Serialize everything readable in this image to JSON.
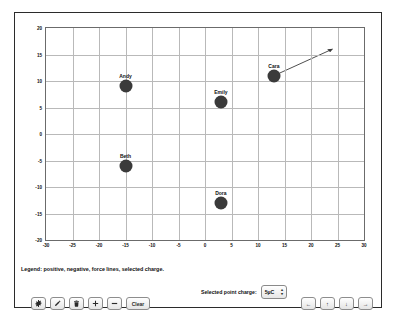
{
  "chart_data": {
    "type": "scatter",
    "title": "",
    "xlabel": "",
    "ylabel": "",
    "xlim": [
      -30,
      30
    ],
    "ylim": [
      -20,
      20
    ],
    "xticks": [
      "-30",
      "-25",
      "-20",
      "-15",
      "-10",
      "-5",
      "0",
      "5",
      "10",
      "15",
      "20",
      "25",
      "30"
    ],
    "yticks": [
      "20",
      "15",
      "10",
      "5",
      "0",
      "-5",
      "-10",
      "-15",
      "-20"
    ],
    "grid": true,
    "legend_position": "below-plot",
    "points": [
      {
        "label": "Andy",
        "x": -15,
        "y": 9,
        "marker": "filled-circle",
        "color": "#3a3a3a"
      },
      {
        "label": "Beth",
        "x": -15,
        "y": -6,
        "marker": "filled-circle",
        "color": "#3a3a3a"
      },
      {
        "label": "Cara",
        "x": 13,
        "y": 11,
        "marker": "filled-circle",
        "color": "#3a3a3a"
      },
      {
        "label": "Dora",
        "x": 3,
        "y": -13,
        "marker": "filled-circle",
        "color": "#3a3a3a"
      },
      {
        "label": "Emily",
        "x": 3,
        "y": 6,
        "marker": "filled-circle",
        "color": "#3a3a3a"
      }
    ],
    "vectors": [
      {
        "from_label": "Cara",
        "x1": 13,
        "y1": 11,
        "x2": 24,
        "y2": 16,
        "style": "arrow",
        "color": "#3a3a3a"
      }
    ]
  },
  "legend": {
    "text": "Legend: positive, negative, force lines, selected charge."
  },
  "charge_selector": {
    "label": "Selected point charge:",
    "value": "5µC",
    "options": [
      "5µC"
    ]
  },
  "tool_buttons": [
    {
      "name": "settings",
      "icon": "gear-icon",
      "label": ""
    },
    {
      "name": "edit",
      "icon": "pencil-icon",
      "label": ""
    },
    {
      "name": "delete",
      "icon": "trash-icon",
      "label": ""
    },
    {
      "name": "increase",
      "icon": "plus-icon",
      "label": ""
    },
    {
      "name": "decrease",
      "icon": "minus-icon",
      "label": ""
    },
    {
      "name": "clear",
      "icon": "",
      "label": "Clear"
    }
  ],
  "nav_buttons": [
    {
      "name": "move-left",
      "icon": "arrow-left-icon",
      "glyph": "←"
    },
    {
      "name": "move-up",
      "icon": "arrow-up-icon",
      "glyph": "↑"
    },
    {
      "name": "move-down",
      "icon": "arrow-down-icon",
      "glyph": "↓"
    },
    {
      "name": "move-right",
      "icon": "arrow-right-icon",
      "glyph": "→"
    }
  ]
}
